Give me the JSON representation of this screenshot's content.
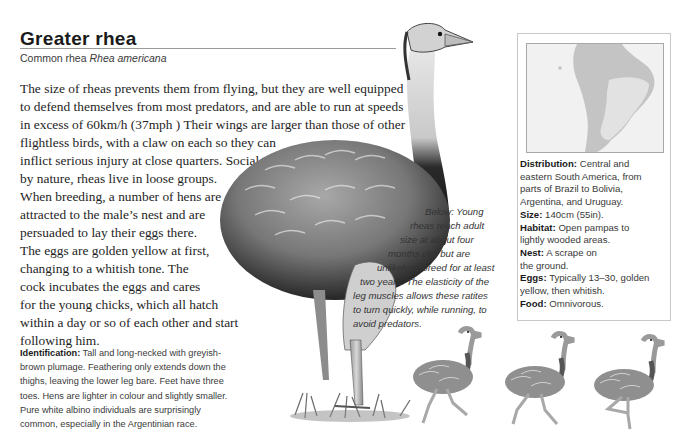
{
  "header": {
    "title": "Greater rhea",
    "subtitle_common": "Common rhea",
    "subtitle_scientific": "Rhea americana"
  },
  "body_text": {
    "lines": [
      "The size of rheas prevents them from flying, but they are well equipped",
      "to defend themselves from most predators, and are able to run at speeds",
      "in excess of 60km/h (37mph ) Their wings are larger than those of other",
      "flightless birds, with a claw on each so they can",
      "inflict serious injury at close quarters. Social",
      "by nature, rheas live in loose groups.",
      "When breeding, a number of hens are",
      "attracted to the male’s nest and are",
      "persuaded to lay their eggs there.",
      "The eggs are golden yellow at first,",
      "changing to a whitish tone. The",
      "cock incubates the eggs and cares",
      "for the young chicks, which all hatch",
      "within a day or so of each other and start",
      "following him."
    ]
  },
  "identification": {
    "label": "Identification:",
    "lines": [
      " Tall and long-necked with greyish-",
      "brown plumage. Feathering only extends down the",
      "thighs, leaving the lower leg bare. Feet have three",
      "toes. Hens are lighter in colour and slightly smaller.",
      "Pure white albino individuals are surprisingly",
      "common, especially in the Argentinian race."
    ]
  },
  "caption": {
    "lines": [
      "Below: Young",
      "rheas reach adult",
      "size at about four",
      "months old, but are",
      "unlikely to breed for at least",
      "two years. The elasticity of the",
      "leg muscles allows these ratites",
      "to turn quickly, while running, to",
      "avoid predators."
    ]
  },
  "infobox": {
    "map_label": "South America range map",
    "facts": {
      "distribution": {
        "label": "Distribution:",
        "lines": [
          " Central and",
          "eastern South America, from",
          "parts of Brazil to Bolivia,",
          "Argentina, and Uruguay."
        ]
      },
      "size": {
        "label": "Size:",
        "value": " 140cm (55in)."
      },
      "habitat": {
        "label": "Habitat:",
        "lines": [
          " Open pampas to",
          "lightly wooded areas."
        ]
      },
      "nest": {
        "label": "Nest:",
        "lines": [
          " A scrape on",
          "the ground."
        ]
      },
      "eggs": {
        "label": "Eggs:",
        "lines": [
          " Typically 13–30, golden",
          "yellow, then whitish."
        ]
      },
      "food": {
        "label": "Food:",
        "value": " Omnivorous."
      }
    }
  },
  "illustrations": {
    "main": "adult-rhea-illustration",
    "small": [
      "young-rhea-running-1",
      "young-rhea-running-2",
      "young-rhea-running-3"
    ]
  },
  "colors": {
    "text": "#1e1e1e",
    "rule": "#9a9a9a",
    "map_land": "#c4c4c4",
    "map_range": "#e8e8e8",
    "map_sea": "#f1f1f1",
    "box_border": "#c8c8c8"
  }
}
